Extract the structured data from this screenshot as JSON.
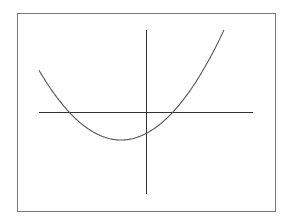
{
  "chart_data": {
    "type": "line",
    "title": "",
    "xlabel": "",
    "ylabel": "",
    "function": "y = x^2 + x - 1 (illustrative; roots one left and one right of origin, vertex left of y-axis below x-axis)",
    "xlim": [
      -3.5,
      4.5
    ],
    "ylim": [
      -3.3,
      3.3
    ],
    "grid": false,
    "legend": null,
    "series": [
      {
        "name": "parabola",
        "color": "#555555",
        "x": [
          -2.6,
          -2.0,
          -1.5,
          -1.0,
          -0.5,
          0.0,
          0.5,
          1.0,
          1.5,
          2.0,
          2.6
        ],
        "y": [
          3.16,
          1.0,
          -0.25,
          -1.0,
          -1.25,
          -1.0,
          -0.25,
          1.0,
          2.75,
          5.0,
          8.36
        ]
      }
    ]
  },
  "colors": {
    "frame": "#777777",
    "axis": "#333333",
    "curve": "#555555",
    "background": "#ffffff"
  },
  "geometry": {
    "frame": {
      "x": 17,
      "y": 13,
      "w": 258,
      "h": 198
    },
    "x_axis": {
      "x1": 39,
      "x2": 253,
      "y": 112
    },
    "y_axis": {
      "x": 146,
      "y1": 30,
      "y2": 194
    },
    "curve_points": [
      [
        39,
        73
      ],
      [
        50,
        88
      ],
      [
        60,
        100
      ],
      [
        68,
        112
      ],
      [
        80,
        124
      ],
      [
        95,
        134
      ],
      [
        110,
        139
      ],
      [
        121,
        140
      ],
      [
        135,
        138
      ],
      [
        146,
        133
      ],
      [
        158,
        125
      ],
      [
        172,
        112
      ],
      [
        185,
        96
      ],
      [
        200,
        72
      ],
      [
        212,
        52
      ],
      [
        224,
        30
      ]
    ]
  }
}
